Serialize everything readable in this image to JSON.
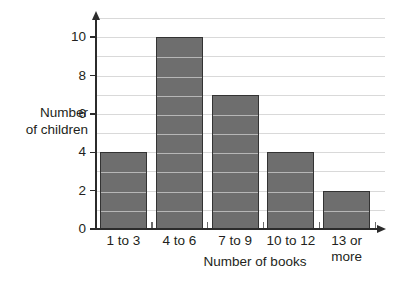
{
  "chart_data": {
    "type": "bar",
    "title": "",
    "subtitle": "",
    "xlabel": "Number of books",
    "ylabel": "Number\nof children",
    "categories": [
      "1 to 3",
      "4 to 6",
      "7 to 9",
      "10 to 12",
      "13 or\nmore"
    ],
    "values": [
      4,
      10,
      7,
      4,
      2
    ],
    "ylim": [
      0,
      11
    ],
    "ytick_labels": [
      "0",
      "2",
      "4",
      "6",
      "8",
      "10"
    ],
    "ytick_values": [
      0,
      2,
      4,
      6,
      8,
      10
    ],
    "gridlines": true,
    "gridline_step": 1,
    "grid_values": [
      1,
      2,
      3,
      4,
      5,
      6,
      7,
      8,
      9,
      10,
      11
    ],
    "legend": "none",
    "legend_position": "none",
    "bar_fill_color": "#6e6e6e",
    "bar_border_color": "#333333",
    "gridline_color": "#d9d9d9",
    "axis_color": "#2b2b2b",
    "background_color": "#ffffff",
    "text_color": "#231f20"
  }
}
